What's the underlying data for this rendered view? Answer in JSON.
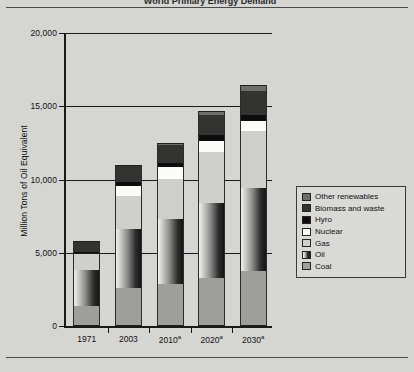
{
  "figure": {
    "title_partial": "World Primary Energy Demand",
    "background_color": "#d5d5d2"
  },
  "chart_data": {
    "type": "bar",
    "subtype": "stacked-bar",
    "title": "World Primary Energy Demand",
    "xlabel": "",
    "ylabel": "Million Tons of Oil Equivalent",
    "ylim": [
      0,
      20000
    ],
    "yticks": [
      0,
      5000,
      10000,
      15000,
      20000
    ],
    "ytick_labels": [
      "0",
      "5,000",
      "10,000",
      "15,000",
      "20,000"
    ],
    "grid": true,
    "grid_axis": "y",
    "legend_position": "right-inside",
    "categories": [
      "1971",
      "2003",
      "2010a",
      "2020a",
      "2030a"
    ],
    "category_labels": [
      "1971",
      "2003",
      "2010",
      "2020",
      "2030"
    ],
    "category_superscripts": [
      "",
      "",
      "a",
      "a",
      "a"
    ],
    "stack_order_bottom_to_top": [
      "Coal",
      "Oil",
      "Gas",
      "Nuclear",
      "Hyro",
      "Biomass and waste",
      "Other renewables"
    ],
    "series": [
      {
        "name": "Coal",
        "color": "#9e9e9b",
        "values": [
          1400,
          2580,
          2900,
          3300,
          3750
        ]
      },
      {
        "name": "Oil",
        "color": "#2e2e2e",
        "values": [
          2450,
          4020,
          4400,
          5100,
          5650
        ]
      },
      {
        "name": "Gas",
        "color": "#cfcfcc",
        "values": [
          1100,
          2280,
          2750,
          3500,
          3900
        ]
      },
      {
        "name": "Nuclear",
        "color": "#fbfbf8",
        "values": [
          30,
          690,
          780,
          760,
          700
        ]
      },
      {
        "name": "Hyro",
        "color": "#0d0d0d",
        "values": [
          100,
          230,
          280,
          360,
          420
        ]
      },
      {
        "name": "Biomass and waste",
        "color": "#333331",
        "values": [
          670,
          1140,
          1240,
          1400,
          1600
        ]
      },
      {
        "name": "Other renewables",
        "color": "#6e6e6b",
        "values": [
          10,
          60,
          130,
          280,
          430
        ]
      }
    ],
    "totals": [
      5760,
      11000,
      12480,
      14700,
      16450
    ],
    "legend_entries": [
      {
        "label": "Other renewables",
        "swatch": "#6e6e6b"
      },
      {
        "label": "Biomass and waste",
        "swatch": "#333331"
      },
      {
        "label": "Hyro",
        "swatch": "#0d0d0d"
      },
      {
        "label": "Nuclear",
        "swatch": "#fbfbf8"
      },
      {
        "label": "Gas",
        "swatch": "#cfcfcc"
      },
      {
        "label": "Oil",
        "swatch": "#2e2e2e"
      },
      {
        "label": "Coal",
        "swatch": "#9e9e9b"
      }
    ]
  }
}
